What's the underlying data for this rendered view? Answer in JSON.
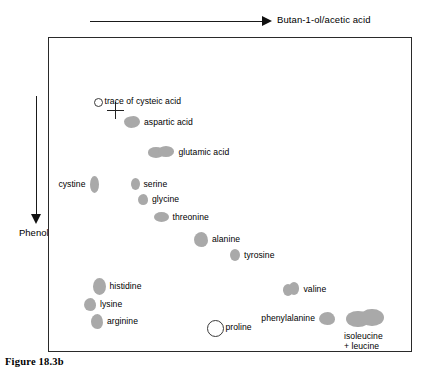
{
  "figure": {
    "caption": "Figure 18.3b",
    "solvent_axis_horizontal": "Butan-1-ol/acetic acid",
    "solvent_axis_vertical": "Phenol",
    "origin_marker": "cross"
  },
  "chart_data": {
    "type": "scatter",
    "xlabel": "Butan-1-ol/acetic acid",
    "ylabel": "Phenol",
    "grid": false,
    "legend": "none",
    "axis_directions": {
      "x": "left to right",
      "y": "top to bottom"
    },
    "origin": {
      "x": 66,
      "y": 72,
      "marker": "cross"
    },
    "spots": [
      {
        "name": "trace of cysteic acid",
        "label": "trace of cysteic acid",
        "x": 96,
        "y": 100,
        "w": 7,
        "h": 7,
        "fill": "hollow",
        "shape": "circle",
        "label_side": "right"
      },
      {
        "name": "aspartic acid",
        "label": "aspartic acid",
        "x": 131,
        "y": 121,
        "w": 16,
        "h": 12,
        "fill": "solid",
        "shape": "kidney",
        "label_side": "right"
      },
      {
        "name": "glutamic acid",
        "label": "glutamic acid",
        "x": 160,
        "y": 151,
        "w": 27,
        "h": 12,
        "fill": "solid",
        "shape": "double",
        "label_side": "right"
      },
      {
        "name": "cystine",
        "label": "cystine",
        "x": 93,
        "y": 183,
        "w": 9,
        "h": 17,
        "fill": "solid",
        "shape": "oval",
        "label_side": "left"
      },
      {
        "name": "serine",
        "label": "serine",
        "x": 134,
        "y": 183,
        "w": 9,
        "h": 12,
        "fill": "solid",
        "shape": "oval",
        "label_side": "right"
      },
      {
        "name": "glycine",
        "label": "glycine",
        "x": 142,
        "y": 198,
        "w": 10,
        "h": 11,
        "fill": "solid",
        "shape": "blob",
        "label_side": "right"
      },
      {
        "name": "threonine",
        "label": "threonine",
        "x": 160,
        "y": 216,
        "w": 15,
        "h": 10,
        "fill": "solid",
        "shape": "oval",
        "label_side": "right"
      },
      {
        "name": "alanine",
        "label": "alanine",
        "x": 200,
        "y": 238,
        "w": 14,
        "h": 15,
        "fill": "solid",
        "shape": "blob",
        "label_side": "right"
      },
      {
        "name": "tyrosine",
        "label": "tyrosine",
        "x": 234,
        "y": 254,
        "w": 10,
        "h": 12,
        "fill": "solid",
        "shape": "oval",
        "label_side": "right"
      },
      {
        "name": "histidine",
        "label": "histidine",
        "x": 98,
        "y": 285,
        "w": 13,
        "h": 17,
        "fill": "solid",
        "shape": "oval",
        "label_side": "right"
      },
      {
        "name": "lysine",
        "label": "lysine",
        "x": 89,
        "y": 303,
        "w": 12,
        "h": 13,
        "fill": "solid",
        "shape": "blob",
        "label_side": "right"
      },
      {
        "name": "arginine",
        "label": "arginine",
        "x": 96,
        "y": 320,
        "w": 12,
        "h": 15,
        "fill": "solid",
        "shape": "blob",
        "label_side": "right"
      },
      {
        "name": "proline",
        "label": "proline",
        "x": 213,
        "y": 326,
        "w": 15,
        "h": 15,
        "fill": "hollow",
        "shape": "circle",
        "label_side": "right"
      },
      {
        "name": "valine",
        "label": "valine",
        "x": 290,
        "y": 288,
        "w": 17,
        "h": 14,
        "fill": "solid",
        "shape": "double",
        "label_side": "right"
      },
      {
        "name": "phenylalanine",
        "label": "phenylalanine",
        "x": 326,
        "y": 317,
        "w": 16,
        "h": 13,
        "fill": "solid",
        "shape": "blob",
        "label_side": "left"
      },
      {
        "name": "isoleucine-leucine",
        "label": "isoleucine\n+ leucine",
        "x": 364,
        "y": 317,
        "w": 38,
        "h": 19,
        "fill": "solid",
        "shape": "double",
        "label_side": "below"
      }
    ],
    "spot_color": "#a9a9a9",
    "plate_border_color": "#2a2a2a",
    "background": "#ffffff"
  }
}
